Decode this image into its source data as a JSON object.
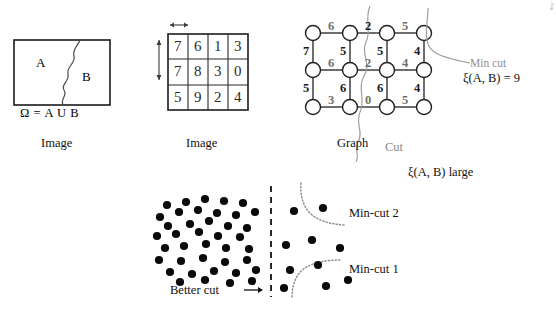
{
  "figure": {
    "panel_image_set": {
      "caption": "Image",
      "region_a_label": "A",
      "region_b_label": "B",
      "omega_label": "Ω = A U B"
    },
    "panel_image_grid": {
      "caption": "Image",
      "grid": [
        [
          "7",
          "6",
          "1",
          "3"
        ],
        [
          "7",
          "8",
          "3",
          "0"
        ],
        [
          "5",
          "9",
          "2",
          "4"
        ]
      ],
      "h_arrow": "horizontal-spacing-arrow",
      "v_arrow": "vertical-spacing-arrow"
    },
    "panel_graph": {
      "caption": "Graph",
      "cut_label": "Cut",
      "min_cut_label": "Min cut",
      "min_cut_value": "ξ(A, B) = 9",
      "horizontal_weights": [
        [
          "6",
          "2",
          "5"
        ],
        [
          "6",
          "2",
          "4"
        ],
        [
          "3",
          "0",
          "5"
        ]
      ],
      "vertical_weights": [
        [
          "7",
          "5",
          "5",
          "4"
        ],
        [
          "5",
          "6",
          "6",
          "4"
        ]
      ]
    },
    "panel_scatter": {
      "better_cut_label": "Better cut",
      "better_cut_arrow": "→",
      "min_cut_1_label": "Min-cut 1",
      "min_cut_2_label": "Min-cut 2",
      "xi_large_label": "ξ(A, B) large",
      "dense_cluster_points": [
        [
          167,
          205
        ],
        [
          186,
          202
        ],
        [
          205,
          199
        ],
        [
          224,
          201
        ],
        [
          243,
          203
        ],
        [
          160,
          217
        ],
        [
          179,
          212
        ],
        [
          198,
          210
        ],
        [
          217,
          213
        ],
        [
          236,
          215
        ],
        [
          255,
          212
        ],
        [
          168,
          226
        ],
        [
          190,
          224
        ],
        [
          209,
          221
        ],
        [
          228,
          226
        ],
        [
          247,
          228
        ],
        [
          157,
          236
        ],
        [
          176,
          234
        ],
        [
          199,
          232
        ],
        [
          218,
          236
        ],
        [
          240,
          237
        ],
        [
          165,
          248
        ],
        [
          184,
          246
        ],
        [
          206,
          244
        ],
        [
          226,
          248
        ],
        [
          249,
          249
        ],
        [
          159,
          260
        ],
        [
          181,
          261
        ],
        [
          203,
          258
        ],
        [
          225,
          262
        ],
        [
          247,
          260
        ],
        [
          170,
          272
        ],
        [
          192,
          274
        ],
        [
          214,
          271
        ],
        [
          236,
          273
        ],
        [
          256,
          270
        ],
        [
          180,
          282
        ],
        [
          205,
          280
        ],
        [
          230,
          283
        ],
        [
          252,
          281
        ]
      ],
      "sparse_points": [
        [
          294,
          211
        ],
        [
          323,
          208
        ],
        [
          286,
          245
        ],
        [
          312,
          240
        ],
        [
          340,
          248
        ],
        [
          290,
          270
        ],
        [
          318,
          265
        ],
        [
          284,
          288
        ],
        [
          326,
          286
        ],
        [
          348,
          280
        ]
      ],
      "divider": "dashed-vertical-line"
    },
    "citation": "Based on J. Shi and J. Malik, Normalized cuts and image segmentation, IEEE Transactions on Pattern Analysis and Machine Intelligence, 22(8):888-905, Aug. 2000."
  }
}
